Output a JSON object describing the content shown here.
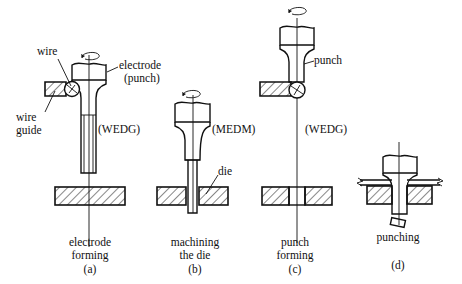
{
  "diagram": {
    "type": "process-sequence",
    "panels": [
      {
        "id": "a",
        "caption_line1": "electrode",
        "caption_line2": "forming",
        "letter": "(a)",
        "method": "(WEDG)",
        "labels": {
          "wire": "wire",
          "wire_guide_line1": "wire",
          "wire_guide_line2": "guide",
          "electrode_line1": "electrode",
          "electrode_line2": "(punch)"
        }
      },
      {
        "id": "b",
        "caption_line1": "machining",
        "caption_line2": "the die",
        "letter": "(b)",
        "method": "(MEDM)",
        "labels": {
          "die": "die"
        }
      },
      {
        "id": "c",
        "caption_line1": "punch",
        "caption_line2": "forming",
        "letter": "(c)",
        "method": "(WEDG)",
        "labels": {
          "punch": "punch"
        }
      },
      {
        "id": "d",
        "caption_line1": "punching",
        "letter": "(d)"
      }
    ],
    "colors": {
      "ink": "#111111",
      "background": "#ffffff"
    }
  }
}
